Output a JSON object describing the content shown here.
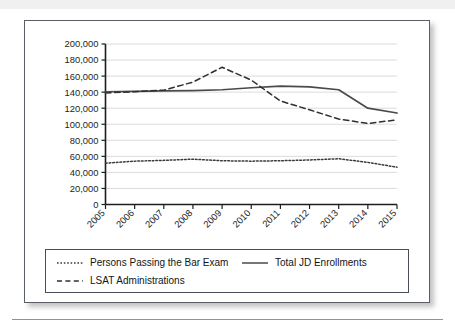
{
  "chart_data": {
    "type": "line",
    "title": "",
    "xlabel": "",
    "ylabel": "",
    "x": [
      2005,
      2006,
      2007,
      2008,
      2009,
      2010,
      2011,
      2012,
      2013,
      2014,
      2015
    ],
    "categories": [
      "2005",
      "2006",
      "2007",
      "2008",
      "2009",
      "2010",
      "2011",
      "2012",
      "2013",
      "2014",
      "2015"
    ],
    "ylim": [
      0,
      200000
    ],
    "yticks": [
      0,
      20000,
      40000,
      60000,
      80000,
      100000,
      120000,
      140000,
      160000,
      180000,
      200000
    ],
    "ytick_labels": [
      "0",
      "20,000",
      "40,000",
      "60,000",
      "80,000",
      "100,000",
      "120,000",
      "140,000",
      "160,000",
      "180,000",
      "200,000"
    ],
    "grid": true,
    "grid_axis": "y",
    "legend_position": "bottom",
    "series": [
      {
        "name": "Persons Passing the Bar Exam",
        "style": "dotted",
        "color": "#3a3a3a",
        "values": [
          51500,
          54000,
          55000,
          56500,
          54500,
          54000,
          54500,
          55500,
          57000,
          52500,
          46500
        ]
      },
      {
        "name": "Total JD Enrollments",
        "style": "solid",
        "color": "#4a4a4a",
        "values": [
          140500,
          141000,
          141500,
          142000,
          143000,
          145500,
          147500,
          146500,
          143000,
          120000,
          114000
        ]
      },
      {
        "name": "LSAT Administrations",
        "style": "dashed",
        "color": "#2f2f2f",
        "values": [
          139000,
          140500,
          142500,
          152500,
          171000,
          155000,
          129000,
          118000,
          106500,
          101000,
          105500
        ]
      }
    ]
  },
  "legend": {
    "items": [
      {
        "label": "Persons Passing the Bar Exam",
        "marker": "dotted-line-icon"
      },
      {
        "label": "Total JD Enrollments",
        "marker": "solid-line-icon"
      },
      {
        "label": "LSAT Administrations",
        "marker": "dashed-line-icon"
      }
    ]
  }
}
